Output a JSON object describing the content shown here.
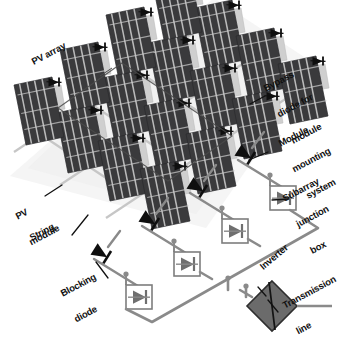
{
  "diagram": {
    "background_color": "#ffffff",
    "colors": {
      "panel_dark": "#3a3a3c",
      "panel_cell_line": "#d8d8d8",
      "mounting_rail": "#cfcfcf",
      "ground_texture": "#e8e8e8",
      "wire": "#8a8a8a",
      "diode_black": "#0f0f0f",
      "junction_box_fill": "#ffffff",
      "junction_box_stroke": "#7d7d7d",
      "junction_diode": "#6f6f6f",
      "inverter_fill": "#6b6b6b",
      "inverter_stroke": "#2e2e2e",
      "label_text": "#111111",
      "leader_line": "#111111",
      "bracket": "#555555"
    },
    "labels": [
      {
        "id": "pv-array",
        "text": "PV array",
        "lines": [
          "PV array"
        ],
        "rotation": -28,
        "x": 30,
        "y": 58,
        "size": 9.5
      },
      {
        "id": "bypass-diode",
        "text": "Bypass diode for module",
        "lines": [
          "Bypass",
          "diode for",
          "module"
        ],
        "rotation": -28,
        "x": 253,
        "y": 68,
        "size": 9.5
      },
      {
        "id": "module-mounting",
        "text": "Module mounting system",
        "lines": [
          "Module",
          "mounting",
          "system"
        ],
        "rotation": -28,
        "x": 268,
        "y": 123,
        "size": 9.5
      },
      {
        "id": "subarray-box",
        "text": "Subarray junction box",
        "lines": [
          "Subarray",
          "junction",
          "box"
        ],
        "rotation": -28,
        "x": 272,
        "y": 178,
        "size": 9.5
      },
      {
        "id": "pv-module",
        "text": "PV module",
        "lines": [
          "PV",
          "module"
        ],
        "rotation": -28,
        "x": 5,
        "y": 196,
        "size": 9.5
      },
      {
        "id": "string",
        "text": "String",
        "lines": [
          "String"
        ],
        "rotation": -28,
        "x": 28,
        "y": 234,
        "size": 9.5
      },
      {
        "id": "blocking-diode",
        "text": "Blocking diode",
        "lines": [
          "Blocking",
          "diode"
        ],
        "rotation": -28,
        "x": 50,
        "y": 273,
        "size": 9.5
      },
      {
        "id": "inverter",
        "text": "Inverter",
        "lines": [
          "Inverter"
        ],
        "rotation": -40,
        "x": 258,
        "y": 264,
        "size": 9.5
      },
      {
        "id": "transmission",
        "text": "Transmission line",
        "lines": [
          "Transmission",
          "line"
        ],
        "rotation": -28,
        "x": 272,
        "y": 285,
        "size": 9.5
      }
    ],
    "components": {
      "pv_panel_count": 16,
      "bypass_diode_count": 16,
      "string_blocking_diode_count": 4,
      "subarray_junction_box_count": 4,
      "inverter_count": 1,
      "transmission_line_count": 1
    },
    "panels": [
      {
        "cx": 186,
        "cy": 45
      },
      {
        "cx": 232,
        "cy": 73
      },
      {
        "cx": 278,
        "cy": 101
      },
      {
        "cx": 140,
        "cy": 80
      },
      {
        "cx": 186,
        "cy": 108
      },
      {
        "cx": 232,
        "cy": 136
      },
      {
        "cx": 94,
        "cy": 115
      },
      {
        "cx": 140,
        "cy": 143
      },
      {
        "cx": 186,
        "cy": 171
      },
      {
        "cx": 48,
        "cy": 150
      },
      {
        "cx": 94,
        "cy": 178
      },
      {
        "cx": 140,
        "cy": 206
      },
      {
        "cx": 214,
        "cy": 30
      },
      {
        "cx": 168,
        "cy": 65
      },
      {
        "cx": 122,
        "cy": 100
      },
      {
        "cx": 76,
        "cy": 135
      }
    ],
    "junction_boxes": [
      {
        "x": 281,
        "y": 196
      },
      {
        "x": 233,
        "y": 229
      },
      {
        "x": 185,
        "y": 262
      },
      {
        "x": 137,
        "y": 295
      }
    ],
    "blocking_diodes": [
      {
        "x": 245,
        "y": 154
      },
      {
        "x": 197,
        "y": 187
      },
      {
        "x": 149,
        "y": 220
      },
      {
        "x": 101,
        "y": 253
      }
    ],
    "inverter": {
      "x": 258,
      "y": 306,
      "w": 46,
      "h": 46
    }
  }
}
